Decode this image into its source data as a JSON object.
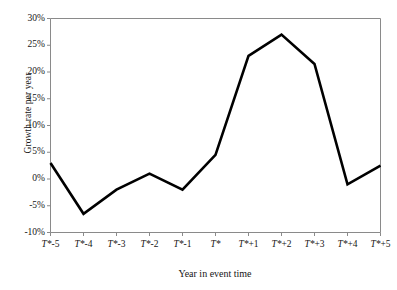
{
  "chart_data": {
    "type": "line",
    "title": "",
    "xlabel": "Year in event time",
    "ylabel": "Growth rate per year",
    "categories": [
      "T*-5",
      "T*-4",
      "T*-3",
      "T*-2",
      "T*-1",
      "T*",
      "T*+1",
      "T*+2",
      "T*+3",
      "T*+4",
      "T*+5"
    ],
    "values": [
      3,
      -6.5,
      -2,
      1,
      -2,
      4.5,
      23,
      27,
      21.5,
      -1,
      2.5
    ],
    "ytick_labels": [
      "30%",
      "25%",
      "20%",
      "15%",
      "10%",
      "5%",
      "0%",
      "-5%",
      "-10%"
    ],
    "ytick_values": [
      30,
      25,
      20,
      15,
      10,
      5,
      0,
      -5,
      -10
    ],
    "ylim": [
      -10,
      30
    ],
    "xlim": [
      0,
      10
    ],
    "grid": false,
    "legend": false,
    "line_color": "#000000",
    "axis_color": "#8a8a8a",
    "background": "#ffffff"
  }
}
